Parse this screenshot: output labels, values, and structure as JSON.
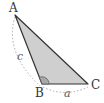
{
  "diagram": {
    "type": "triangle",
    "vertices": [
      {
        "name": "A",
        "x": 15,
        "y": 15
      },
      {
        "name": "B",
        "x": 42,
        "y": 84
      },
      {
        "name": "C",
        "x": 88,
        "y": 84
      }
    ],
    "sides": [
      {
        "name": "c",
        "from": "A",
        "to": "B"
      },
      {
        "name": "a",
        "from": "B",
        "to": "C"
      }
    ],
    "angle_mark": "B",
    "colors": {
      "fill": "#cfcfcf",
      "stroke": "#333333",
      "dotted": "#aaaaaa",
      "angle_fill": "#a8a8a8"
    }
  },
  "labels": {
    "A": "A",
    "B": "B",
    "C": "C",
    "a": "a",
    "c": "c"
  }
}
